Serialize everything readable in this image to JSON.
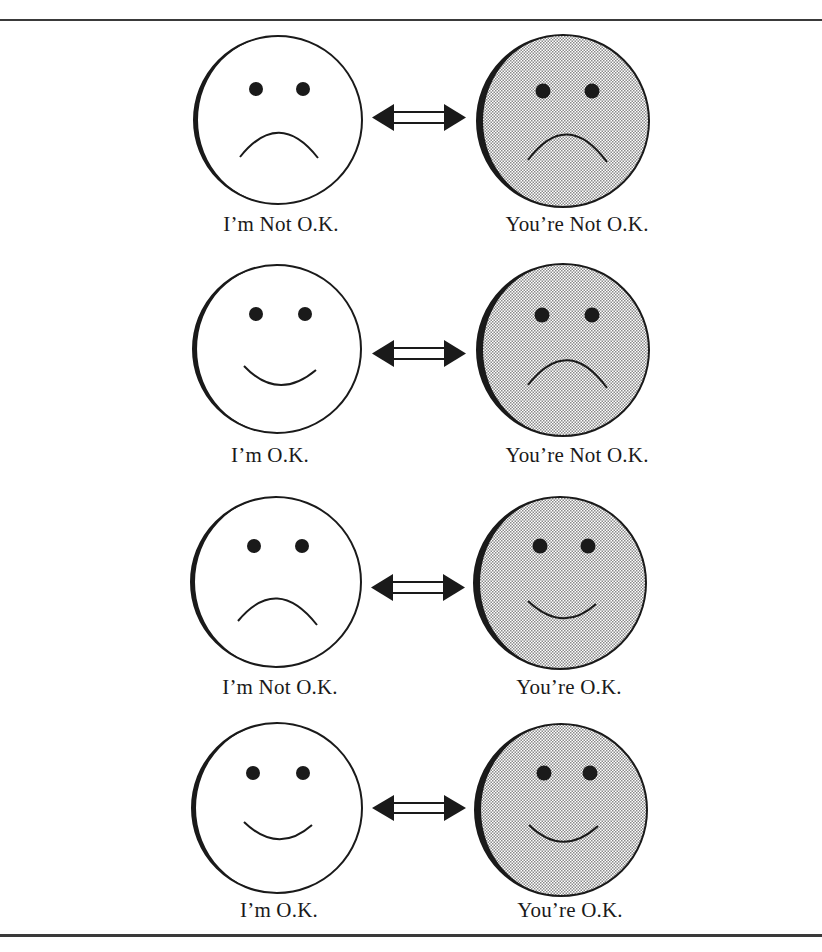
{
  "diagram": {
    "title": "",
    "rows": [
      {
        "left_label": "I’m Not O.K.",
        "right_label": "You’re Not O.K.",
        "left_mood": "sad",
        "right_mood": "sad"
      },
      {
        "left_label": "I’m O.K.",
        "right_label": "You’re Not O.K.",
        "left_mood": "happy",
        "right_mood": "sad"
      },
      {
        "left_label": "I’m Not O.K.",
        "right_label": "You’re O.K.",
        "left_mood": "sad",
        "right_mood": "happy"
      },
      {
        "left_label": "I’m O.K.",
        "right_label": "You’re O.K.",
        "left_mood": "happy",
        "right_mood": "happy"
      }
    ],
    "connector": "double-headed-arrow",
    "colors": {
      "outline": "#1a1a1a",
      "left_face_fill": "#ffffff",
      "right_face_fill_stipple_dark": "#8a8a8a",
      "right_face_fill_stipple_light": "#ffffff",
      "rules": "#3a3a3a"
    }
  }
}
